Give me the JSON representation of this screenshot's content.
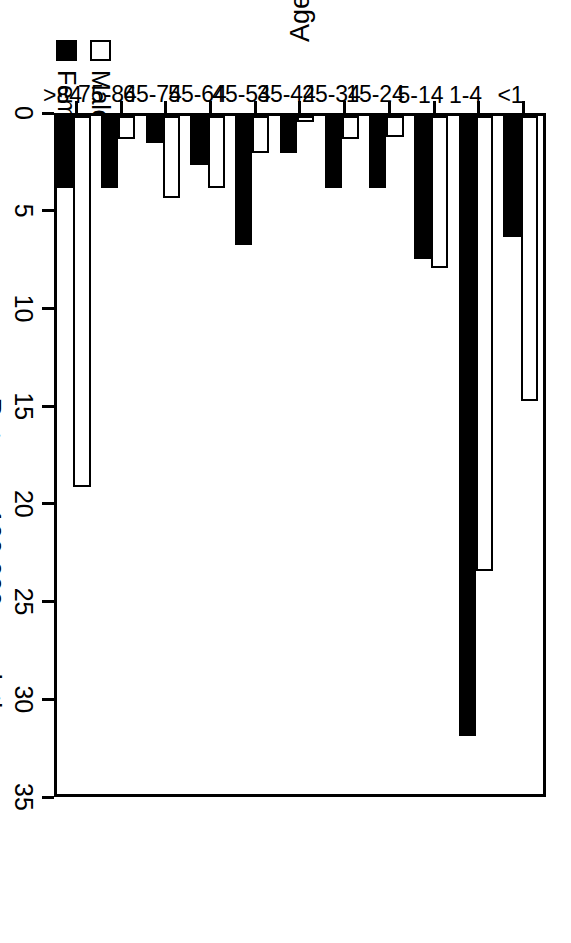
{
  "legend": {
    "items": [
      {
        "label": "Male",
        "swatch": "hollow-square-icon",
        "color": "#ffffff"
      },
      {
        "label": "Female",
        "swatch": "filled-square-icon",
        "color": "#000000"
      }
    ]
  },
  "chart_data": {
    "type": "bar",
    "title": "",
    "xlabel": "Age",
    "ylabel": "Rate per 100,000 population",
    "orientation": "vertical",
    "grid": false,
    "legend_position": "top-left",
    "ylim": [
      0,
      35
    ],
    "yticks": [
      0,
      5,
      10,
      15,
      20,
      25,
      30,
      35
    ],
    "ytick_labels": [
      "0",
      "5",
      "10",
      "15",
      "20",
      "25",
      "30",
      "35"
    ],
    "categories": [
      "<1",
      "1-4",
      "5-14",
      "15-24",
      "25-34",
      "35-44",
      "45-54",
      "55-64",
      "65-74",
      "75-84",
      ">84"
    ],
    "series": [
      {
        "name": "Male",
        "color": "#ffffff",
        "values": [
          14.6,
          23.3,
          7.8,
          1.1,
          1.2,
          0.3,
          1.9,
          3.7,
          4.2,
          1.2,
          19.0
        ]
      },
      {
        "name": "Female",
        "color": "#000000",
        "values": [
          6.2,
          31.7,
          7.3,
          3.7,
          3.7,
          1.9,
          6.6,
          2.5,
          1.4,
          3.7,
          3.7
        ]
      }
    ]
  }
}
